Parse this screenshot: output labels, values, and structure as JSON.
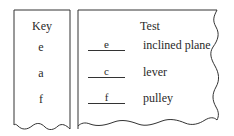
{
  "key_panel": {
    "title": "Key",
    "items": [
      "e",
      "a",
      "f"
    ]
  },
  "test_panel": {
    "title": "Test",
    "rows": [
      {
        "answer": "e",
        "label": "inclined plane"
      },
      {
        "answer": "c",
        "label": "lever"
      },
      {
        "answer": "f",
        "label": "pulley"
      }
    ]
  }
}
